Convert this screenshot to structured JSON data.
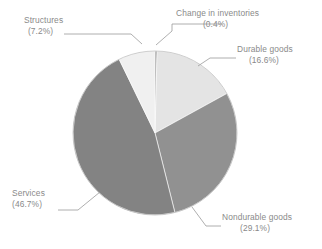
{
  "chart_data": {
    "type": "pie",
    "title": "",
    "subtitle": "",
    "xlabel": "",
    "ylabel": "",
    "legend_position": "none",
    "grid": false,
    "value_unit": "percent",
    "start_angle_deg": 0,
    "direction": "clockwise",
    "categories": [
      "Change in inventories",
      "Durable goods",
      "Nondurable goods",
      "Services",
      "Structures"
    ],
    "values": [
      0.4,
      16.6,
      29.1,
      46.7,
      7.2
    ],
    "colors": [
      "#7d7d7d",
      "#e4e4e4",
      "#919191",
      "#838383",
      "#f0f0f0"
    ],
    "slices": [
      {
        "label": "Change in inventories",
        "value": 0.4,
        "value_text": "(0.4%)",
        "color": "#7d7d7d"
      },
      {
        "label": "Durable goods",
        "value": 16.6,
        "value_text": "(16.6%)",
        "color": "#e4e4e4"
      },
      {
        "label": "Nondurable goods",
        "value": 29.1,
        "value_text": "(29.1%)",
        "color": "#919191"
      },
      {
        "label": "Services",
        "value": 46.7,
        "value_text": "(46.7%)",
        "color": "#838383"
      },
      {
        "label": "Structures",
        "value": 7.2,
        "value_text": "(7.2%)",
        "color": "#f0f0f0"
      }
    ]
  },
  "labels": {
    "structures": {
      "name": "Structures",
      "pct": "(7.2%)"
    },
    "change": {
      "name": "Change in inventories",
      "pct": "(0.4%)"
    },
    "durable": {
      "name": "Durable goods",
      "pct": "(16.6%)"
    },
    "nondurable": {
      "name": "Nondurable goods",
      "pct": "(29.1%)"
    },
    "services": {
      "name": "Services",
      "pct": "(46.7%)"
    }
  },
  "style": {
    "background": "#ffffff",
    "text_color": "#8a8a8a",
    "leader_color": "#9a9a9a"
  }
}
